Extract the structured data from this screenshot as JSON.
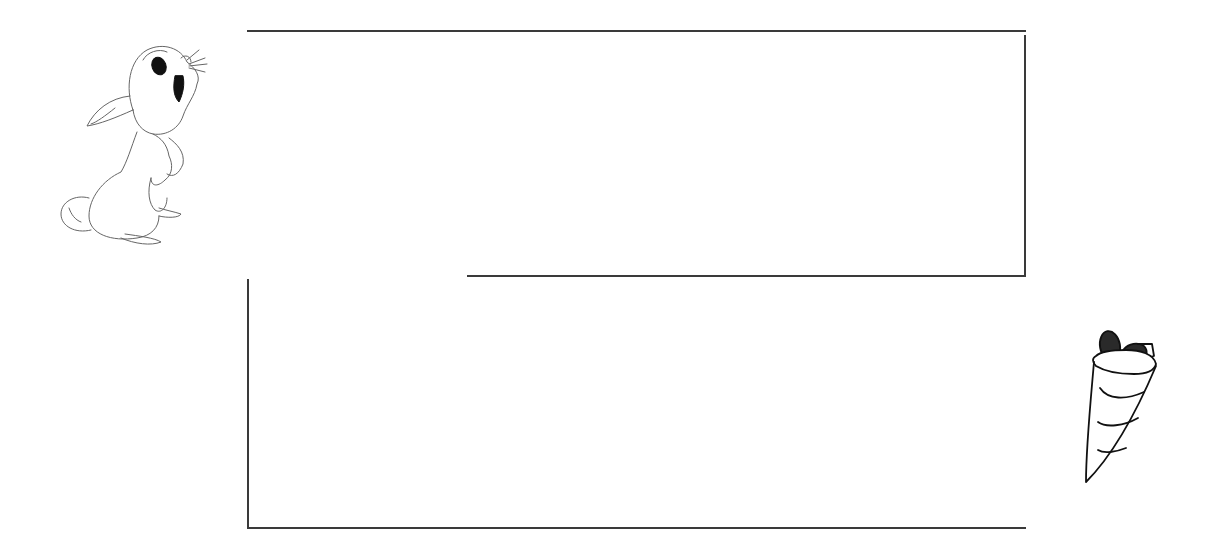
{
  "puzzle": {
    "type": "maze",
    "start_character": "rabbit",
    "goal_item": "carrot",
    "colors": {
      "wall": "#3a3a3a",
      "background": "#ffffff",
      "outline": "#555555",
      "carrot_leaves": "#222222"
    },
    "walls": [
      {
        "id": "top",
        "x": 247,
        "y": 30,
        "w": 779,
        "h": 2
      },
      {
        "id": "right-upper",
        "x": 1024,
        "y": 35,
        "w": 2,
        "h": 242
      },
      {
        "id": "middle",
        "x": 467,
        "y": 275,
        "w": 559,
        "h": 2
      },
      {
        "id": "left-lower",
        "x": 247,
        "y": 279,
        "w": 2,
        "h": 250
      },
      {
        "id": "bottom",
        "x": 247,
        "y": 527,
        "w": 779,
        "h": 2
      }
    ]
  }
}
